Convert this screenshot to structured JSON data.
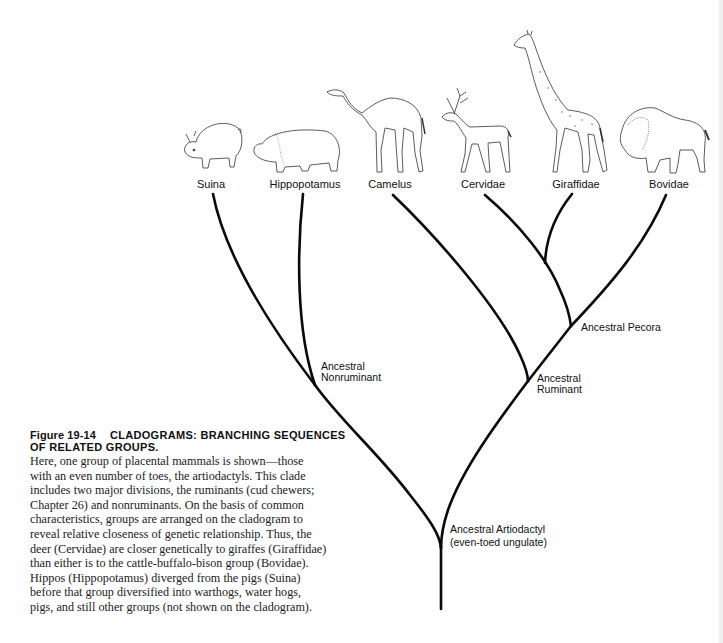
{
  "figure": {
    "number": "Figure 19-14",
    "title_line1": "CLADOGRAMS: BRANCHING SEQUENCES",
    "title_line2": "OF RELATED GROUPS.",
    "body_lines": [
      "Here, one group of placental mammals is shown—those",
      "with an even number of toes, the artiodactyls. This clade",
      "includes two major divisions, the ruminants (cud chewers;",
      "Chapter 26) and nonruminants. On the basis of common",
      "characteristics, groups are arranged on the cladogram to",
      "reveal relative closeness of genetic relationship. Thus, the",
      "deer (Cervidae) are closer genetically to giraffes (Giraffidae)",
      "than either is to the cattle-buffalo-bison group (Bovidae).",
      "Hippos (Hippopotamus) diverged from the pigs (Suina)",
      "before that group diversified into warthogs, water hogs,",
      "pigs, and still other groups (not shown on the cladogram)."
    ]
  },
  "taxa": [
    {
      "label": "Suina",
      "animal": "pig-illustration"
    },
    {
      "label": "Hippopotamus",
      "animal": "hippopotamus-illustration"
    },
    {
      "label": "Camelus",
      "animal": "camel-illustration"
    },
    {
      "label": "Cervidae",
      "animal": "deer-illustration"
    },
    {
      "label": "Giraffidae",
      "animal": "giraffe-illustration"
    },
    {
      "label": "Bovidae",
      "animal": "bison-illustration"
    }
  ],
  "nodes": {
    "nonruminant": {
      "line1": "Ancestral",
      "line2": "Nonruminant"
    },
    "ruminant": {
      "line1": "Ancestral",
      "line2": "Ruminant"
    },
    "pecora": {
      "line1": "Ancestral Pecora"
    },
    "artiodactyl": {
      "line1": "Ancestral Artiodactyl",
      "line2": "(even-toed ungulate)"
    }
  },
  "colors": {
    "line": "#0a0a0a",
    "text": "#111111",
    "sketch": "#333333"
  }
}
